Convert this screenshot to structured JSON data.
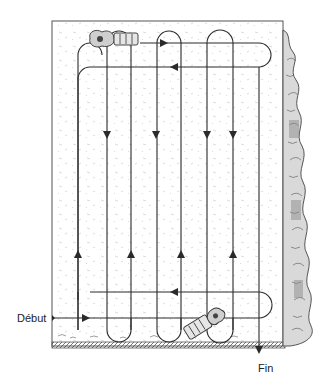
{
  "diagram": {
    "type": "lawn-mowing-pattern",
    "labels": {
      "start": "Début",
      "end": "Fin"
    },
    "colors": {
      "line": "#2a2a2a",
      "frame": "#555555",
      "ground": "#666666",
      "hedge": "#444444",
      "background": "#ffffff"
    },
    "elements": {
      "frame": "lawn-boundary",
      "hedge": "hedge-right-edge",
      "mower_top": "mower-icon",
      "mower_bottom": "mower-icon",
      "path": "serpentine-mowing-path"
    },
    "arrows": {
      "down_count": 4,
      "up_count": 4,
      "horizontal_right": 2,
      "horizontal_left": 2,
      "exit_down": 1
    }
  }
}
